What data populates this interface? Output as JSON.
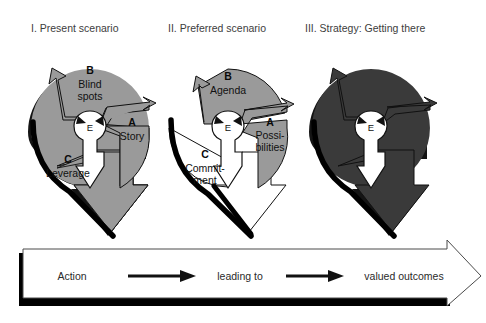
{
  "figure": {
    "kind": "three-panel-cycle-diagram",
    "background": "#ffffff"
  },
  "palette": {
    "mid_gray": "#9a9a9a",
    "dark_gray": "#3a3a3a",
    "white": "#ffffff",
    "outline_black": "#111111",
    "shadow_black": "#000000",
    "title_text": "#3d3d3d",
    "label_text": "#111111"
  },
  "panels": [
    {
      "id": "panel-1",
      "title": "I. Present scenario",
      "center_label": "E",
      "fill": "#9a9a9a",
      "c_fill": "#9a9a9a",
      "wedges": [
        {
          "key": "A",
          "letter": "A",
          "lines": [
            "Story"
          ]
        },
        {
          "key": "B",
          "letter": "B",
          "lines": [
            "Blind",
            "spots"
          ]
        },
        {
          "key": "C",
          "letter": "C",
          "lines": [
            "Leverage"
          ]
        }
      ]
    },
    {
      "id": "panel-2",
      "title": "II. Preferred scenario",
      "center_label": "E",
      "fill": "#9a9a9a",
      "c_fill": "#ffffff",
      "wedges": [
        {
          "key": "A",
          "letter": "A",
          "lines": [
            "Possi-",
            "bilities"
          ]
        },
        {
          "key": "B",
          "letter": "B",
          "lines": [
            "Agenda"
          ]
        },
        {
          "key": "C",
          "letter": "C",
          "lines": [
            "Commit-",
            "ment"
          ]
        }
      ]
    },
    {
      "id": "panel-3",
      "title": "III. Strategy: Getting there",
      "center_label": "E",
      "fill": "#3a3a3a",
      "c_fill": "#3a3a3a",
      "wedges": [
        {
          "key": "A",
          "letter": "",
          "lines": []
        },
        {
          "key": "B",
          "letter": "",
          "lines": []
        },
        {
          "key": "C",
          "letter": "",
          "lines": []
        }
      ]
    }
  ],
  "flow": {
    "steps": [
      "Action",
      "leading to",
      "valued outcomes"
    ],
    "connector_icon": "right-arrow-icon",
    "band_icon": "large-right-arrow-icon"
  }
}
